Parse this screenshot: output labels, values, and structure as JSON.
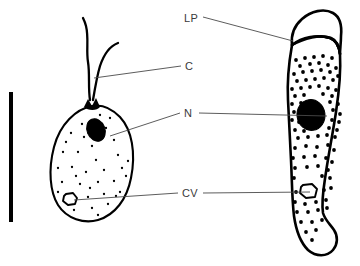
{
  "figure": {
    "background_color": "#ffffff",
    "ink_color": "#000000",
    "leader_color": "#4a4a4a",
    "label_color": "#3a3a3a"
  },
  "labels": [
    {
      "id": "lp",
      "text": "LP",
      "meaning": "lip",
      "x": 184,
      "y": 22,
      "leader_from_x": 203,
      "leader_from_y": 17,
      "leader_to_x": 293,
      "leader_to_y": 41
    },
    {
      "id": "c",
      "text": "C",
      "meaning": "cilia",
      "x": 185,
      "y": 70,
      "leader_from_x": 181,
      "leader_from_y": 66,
      "leader_to_x": 94,
      "leader_to_y": 78
    },
    {
      "id": "n",
      "text": "N",
      "meaning": "nucleus",
      "x": 184,
      "y": 117,
      "leader_left_from_x": 180,
      "leader_left_from_y": 113,
      "leader_left_to_x": 110,
      "leader_left_to_y": 136,
      "leader_right_from_x": 199,
      "leader_right_from_y": 113,
      "leader_right_to_x": 327,
      "leader_right_to_y": 116
    },
    {
      "id": "cv",
      "text": "CV",
      "meaning": "contractile vacuole",
      "x": 182,
      "y": 197,
      "leader_left_from_x": 178,
      "leader_left_from_y": 193,
      "leader_left_to_x": 74,
      "leader_left_to_y": 200,
      "leader_right_from_x": 203,
      "leader_right_from_y": 193,
      "leader_right_to_x": 310,
      "leader_right_to_y": 192
    }
  ],
  "scale_bar": {
    "name": "scale-bar",
    "x": 9,
    "y": 92,
    "width": 4,
    "height": 130
  },
  "left_cell": {
    "name": "flagellate-swarmer-cell",
    "body_path": "M 92 106 C 76 109, 60 124, 54 147 C 48 170, 50 192, 58 205 C 67 219, 84 224, 98 220 C 115 215, 127 199, 131 178 C 136 153, 132 130, 120 117 C 112 109, 102 104, 92 106 Z",
    "nucleus": {
      "cx": 96,
      "cy": 130,
      "rx": 9,
      "ry": 11.5,
      "rotation": -22
    },
    "basal_body": "M 84 107 L 88 99 L 92 106 L 96 98 L 100 107 C 97 111, 88 111, 84 107 Z",
    "vacuole_path": "M 66 194 L 73 193 L 77 198 L 75 204 L 68 205 L 63 201 L 64 196 Z",
    "flagella": [
      "M 90 100 C 88 88, 90 74, 88 62 C 86 50, 89 38, 86 26 C 85 22, 84 20, 83 18",
      "M 93 100 C 95 88, 97 76, 100 66 C 104 54, 110 46, 118 43"
    ],
    "granules": [
      [
        82,
        124
      ],
      [
        71,
        133
      ],
      [
        92,
        146
      ],
      [
        106,
        128
      ],
      [
        114,
        140
      ],
      [
        63,
        152
      ],
      [
        78,
        152
      ],
      [
        96,
        160
      ],
      [
        118,
        155
      ],
      [
        58,
        168
      ],
      [
        72,
        167
      ],
      [
        86,
        172
      ],
      [
        104,
        170
      ],
      [
        122,
        168
      ],
      [
        62,
        182
      ],
      [
        80,
        184
      ],
      [
        98,
        182
      ],
      [
        114,
        181
      ],
      [
        126,
        176
      ],
      [
        68,
        196
      ],
      [
        88,
        197
      ],
      [
        104,
        194
      ],
      [
        120,
        192
      ],
      [
        74,
        210
      ],
      [
        92,
        208
      ],
      [
        108,
        204
      ],
      [
        84,
        137
      ],
      [
        100,
        115
      ],
      [
        110,
        118
      ],
      [
        66,
        142
      ],
      [
        128,
        161
      ],
      [
        58,
        192
      ],
      [
        98,
        215
      ],
      [
        116,
        196
      ],
      [
        76,
        176
      ],
      [
        90,
        188
      ]
    ]
  },
  "right_cell": {
    "name": "attached-stalked-cell",
    "body_path": "M 292 45 C 289 62, 287 82, 288 100 C 289 120, 290 140, 291 160 C 292 180, 292 200, 294 216 C 296 230, 300 242, 308 250 C 316 257, 327 257, 333 250 C 338 244, 338 236, 334 230 C 330 224, 325 220, 323 213 C 321 200, 324 186, 326 172 C 329 152, 333 132, 336 112 C 339 92, 341 72, 340 54 C 339 46, 336 40, 330 38 C 318 34, 302 37, 292 45 Z",
    "lip_path": "M 292 45 C 291 36, 294 26, 302 19 C 311 11, 324 8, 333 13 C 340 17, 342 26, 341 36 C 341 43, 340 49, 340 54 C 339 46, 336 40, 330 38 C 318 34, 302 37, 292 45 Z",
    "lip_divider": "M 292 45 C 304 38, 320 34, 331 38 C 336 40, 339 46, 340 54",
    "nucleus": {
      "cx": 311,
      "cy": 115,
      "rx": 14,
      "ry": 15.5,
      "rotation": -8
    },
    "vacuole_path": "M 303 185 L 312 184 L 317 189 L 315 197 L 306 198 L 300 193 L 301 187 Z",
    "granules_dense": [
      [
        296,
        60
      ],
      [
        305,
        58
      ],
      [
        314,
        57
      ],
      [
        323,
        56
      ],
      [
        332,
        58
      ],
      [
        300,
        66
      ],
      [
        310,
        64
      ],
      [
        319,
        63
      ],
      [
        328,
        65
      ],
      [
        336,
        68
      ],
      [
        294,
        74
      ],
      [
        303,
        72
      ],
      [
        312,
        71
      ],
      [
        321,
        70
      ],
      [
        330,
        72
      ],
      [
        338,
        76
      ],
      [
        297,
        81
      ],
      [
        306,
        80
      ],
      [
        315,
        79
      ],
      [
        324,
        78
      ],
      [
        333,
        80
      ],
      [
        292,
        89
      ],
      [
        301,
        88
      ],
      [
        310,
        87
      ],
      [
        319,
        86
      ],
      [
        328,
        88
      ],
      [
        336,
        90
      ],
      [
        295,
        96
      ],
      [
        304,
        95
      ],
      [
        323,
        94
      ],
      [
        332,
        96
      ],
      [
        292,
        104
      ],
      [
        301,
        103
      ],
      [
        330,
        102
      ],
      [
        338,
        104
      ],
      [
        294,
        112
      ],
      [
        333,
        110
      ],
      [
        340,
        114
      ],
      [
        292,
        120
      ],
      [
        299,
        122
      ],
      [
        332,
        120
      ],
      [
        339,
        122
      ],
      [
        295,
        130
      ],
      [
        304,
        131
      ],
      [
        329,
        128
      ],
      [
        337,
        130
      ],
      [
        298,
        138
      ],
      [
        308,
        137
      ],
      [
        318,
        136
      ],
      [
        327,
        135
      ],
      [
        335,
        137
      ]
    ],
    "granules_sparse": [
      [
        295,
        148
      ],
      [
        306,
        146
      ],
      [
        317,
        147
      ],
      [
        328,
        145
      ],
      [
        334,
        150
      ],
      [
        293,
        158
      ],
      [
        304,
        157
      ],
      [
        315,
        156
      ],
      [
        326,
        158
      ],
      [
        332,
        162
      ],
      [
        295,
        168
      ],
      [
        307,
        167
      ],
      [
        318,
        166
      ],
      [
        328,
        170
      ],
      [
        294,
        178
      ],
      [
        322,
        176
      ],
      [
        330,
        178
      ],
      [
        296,
        192
      ],
      [
        324,
        190
      ],
      [
        331,
        188
      ],
      [
        295,
        202
      ],
      [
        305,
        204
      ],
      [
        316,
        202
      ],
      [
        326,
        200
      ],
      [
        297,
        212
      ],
      [
        308,
        212
      ],
      [
        318,
        210
      ],
      [
        327,
        208
      ],
      [
        301,
        222
      ],
      [
        312,
        222
      ],
      [
        322,
        220
      ],
      [
        306,
        232
      ],
      [
        316,
        230
      ],
      [
        312,
        240
      ]
    ]
  }
}
